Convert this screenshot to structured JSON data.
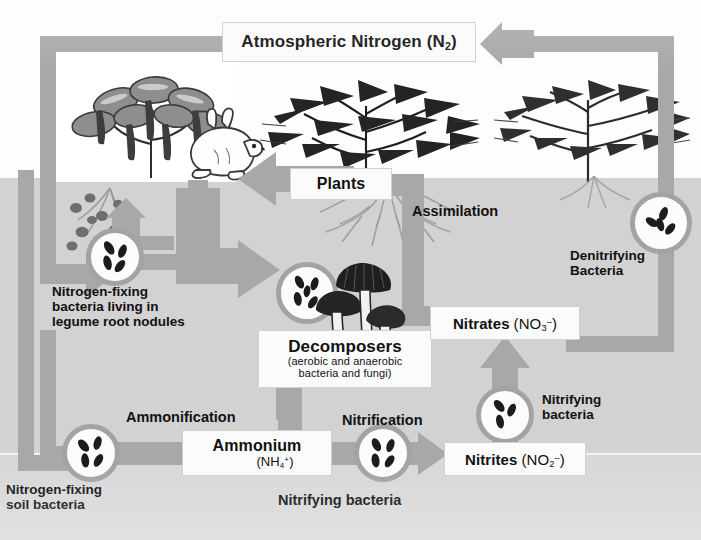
{
  "diagram": {
    "type": "biogeochemical-cycle",
    "palette": {
      "sky": "#fdfdfd",
      "soil": "#d2d2d2",
      "soil_deep": "#d8d8d8",
      "arrow": "#a8a8a8",
      "arrow_dark": "#9c9c9c",
      "box_fill": "#fbfbfb",
      "text": "#111111"
    }
  },
  "boxes": {
    "atmospheric_nitrogen": {
      "name": "Atmospheric Nitrogen",
      "formula_prefix": "(N",
      "formula_sub": "2",
      "formula_suffix": ")"
    },
    "plants": {
      "name": "Plants"
    },
    "decomposers": {
      "name": "Decomposers",
      "line2": "(aerobic and anaerobic",
      "line3": "bacteria and fungi)"
    },
    "nitrates": {
      "name": "Nitrates",
      "formula_prefix": "(NO",
      "formula_sub": "3",
      "formula_charge": "–",
      "formula_suffix": ")"
    },
    "ammonium": {
      "name": "Ammonium",
      "formula_prefix": "(NH",
      "formula_sub": "4",
      "formula_charge": "+",
      "formula_suffix": ")"
    },
    "nitrites": {
      "name": "Nitrites",
      "formula_prefix": "(NO",
      "formula_sub": "2",
      "formula_charge": "–",
      "formula_suffix": ")"
    }
  },
  "labels": {
    "nitrogen_fixing_nodules": "Nitrogen-fixing\nbacteria living in\nlegume root nodules",
    "nitrogen_fixing_nodules_l1": "Nitrogen-fixing",
    "nitrogen_fixing_nodules_l2": "bacteria living in",
    "nitrogen_fixing_nodules_l3": "legume root nodules",
    "nitrogen_fixing_soil_l1": "Nitrogen-fixing",
    "nitrogen_fixing_soil_l2": "soil bacteria",
    "denitrifying_l1": "Denitrifying",
    "denitrifying_l2": "Bacteria",
    "nitrifying_circle_l1": "Nitrifying",
    "nitrifying_circle_l2": "bacteria",
    "assimilation": "Assimilation",
    "ammonification": "Ammonification",
    "nitrification": "Nitrification",
    "nitrifying_bacteria_bottom": "Nitrifying bacteria"
  },
  "icons": {
    "legume_plant": "legume-plant-icon",
    "rabbit": "rabbit-icon",
    "shrub": "shrub-icon",
    "tree": "tree-icon",
    "mushrooms": "mushrooms-icon",
    "roots": "roots-icon",
    "root_nodules": "root-nodules-icon",
    "bacteria": "bacteria-icon"
  },
  "flows": [
    {
      "from": "Atmospheric Nitrogen",
      "to": "Nitrogen-fixing bacteria living in legume root nodules",
      "via": "left descending band"
    },
    {
      "from": "Atmospheric Nitrogen",
      "to": "Nitrogen-fixing soil bacteria",
      "via": "far-left descending band"
    },
    {
      "from": "Nitrogen-fixing bacteria living in legume root nodules",
      "to": "Decomposers",
      "label": ""
    },
    {
      "from": "Plants",
      "to": "Decomposers",
      "label": ""
    },
    {
      "from": "Nitrogen-fixing soil bacteria",
      "to": "Ammonium",
      "label": "Ammonification"
    },
    {
      "from": "Decomposers",
      "to": "Ammonium",
      "label": "Ammonification"
    },
    {
      "from": "Ammonium",
      "to": "Nitrites",
      "label": "Nitrification"
    },
    {
      "from": "Nitrites",
      "to": "Nitrates",
      "label": "Nitrifying bacteria"
    },
    {
      "from": "Nitrates",
      "to": "Plants",
      "label": "Assimilation"
    },
    {
      "from": "Nitrates",
      "to": "Atmospheric Nitrogen",
      "label": "Denitrifying Bacteria"
    }
  ]
}
